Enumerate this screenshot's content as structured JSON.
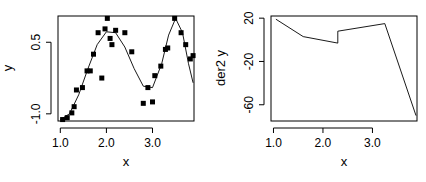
{
  "chart_data": [
    {
      "type": "scatter",
      "title": "",
      "xlabel": "x",
      "ylabel": "y",
      "xlim": [
        0.95,
        3.9
      ],
      "ylim": [
        -1.15,
        1.05
      ],
      "xticks": [
        "1.0",
        "2.0",
        "3.0"
      ],
      "yticks": [
        "-1.0",
        "0.5"
      ],
      "ytick_values": [
        -1.0,
        0.5
      ],
      "xtick_values": [
        1.0,
        2.0,
        3.0
      ],
      "grid": false,
      "legend": null,
      "points": [
        {
          "x": 1.05,
          "y": -1.12
        },
        {
          "x": 1.15,
          "y": -1.08
        },
        {
          "x": 1.25,
          "y": -0.98
        },
        {
          "x": 1.3,
          "y": -0.85
        },
        {
          "x": 1.35,
          "y": -0.5
        },
        {
          "x": 1.48,
          "y": -0.45
        },
        {
          "x": 1.58,
          "y": -0.1
        },
        {
          "x": 1.65,
          "y": -0.1
        },
        {
          "x": 1.72,
          "y": 0.25
        },
        {
          "x": 1.82,
          "y": 0.7
        },
        {
          "x": 1.9,
          "y": -0.25
        },
        {
          "x": 1.97,
          "y": 0.78
        },
        {
          "x": 2.02,
          "y": 1.0
        },
        {
          "x": 2.08,
          "y": 0.58
        },
        {
          "x": 2.12,
          "y": 0.45
        },
        {
          "x": 2.2,
          "y": 0.75
        },
        {
          "x": 2.4,
          "y": 0.7
        },
        {
          "x": 2.55,
          "y": 0.3
        },
        {
          "x": 2.8,
          "y": -0.78
        },
        {
          "x": 2.9,
          "y": -0.45
        },
        {
          "x": 3.0,
          "y": -0.75
        },
        {
          "x": 3.05,
          "y": -0.2
        },
        {
          "x": 3.18,
          "y": 0.0
        },
        {
          "x": 3.28,
          "y": 0.35
        },
        {
          "x": 3.33,
          "y": 0.38
        },
        {
          "x": 3.48,
          "y": 1.0
        },
        {
          "x": 3.62,
          "y": 0.7
        },
        {
          "x": 3.72,
          "y": 0.45
        },
        {
          "x": 3.82,
          "y": 0.15
        },
        {
          "x": 3.88,
          "y": 0.22
        }
      ],
      "fit_curve": [
        {
          "x": 1.0,
          "y": -1.12
        },
        {
          "x": 1.2,
          "y": -1.0
        },
        {
          "x": 1.4,
          "y": -0.6
        },
        {
          "x": 1.6,
          "y": -0.05
        },
        {
          "x": 1.8,
          "y": 0.45
        },
        {
          "x": 2.0,
          "y": 0.72
        },
        {
          "x": 2.2,
          "y": 0.7
        },
        {
          "x": 2.4,
          "y": 0.4
        },
        {
          "x": 2.6,
          "y": -0.05
        },
        {
          "x": 2.8,
          "y": -0.42
        },
        {
          "x": 3.0,
          "y": -0.45
        },
        {
          "x": 3.2,
          "y": 0.05
        },
        {
          "x": 3.35,
          "y": 0.65
        },
        {
          "x": 3.5,
          "y": 1.0
        },
        {
          "x": 3.65,
          "y": 0.7
        },
        {
          "x": 3.78,
          "y": 0.05
        },
        {
          "x": 3.88,
          "y": -0.35
        }
      ]
    },
    {
      "type": "line",
      "title": "",
      "xlabel": "x",
      "ylabel": "der2 y",
      "xlim": [
        0.95,
        3.9
      ],
      "ylim": [
        -75,
        22
      ],
      "xticks": [
        "1.0",
        "2.0",
        "3.0"
      ],
      "xtick_values": [
        1.0,
        2.0,
        3.0
      ],
      "yticks": [
        "20",
        "-20",
        "-60"
      ],
      "ytick_values": [
        20,
        -20,
        -60
      ],
      "grid": false,
      "legend": null,
      "series": [
        {
          "name": "der2 y",
          "x": [
            1.05,
            1.6,
            2.3,
            2.3,
            3.25,
            3.88
          ],
          "y": [
            19,
            3,
            -3,
            8,
            15,
            -70
          ]
        }
      ]
    }
  ],
  "labels": {
    "left": {
      "xlabel": "x",
      "ylabel": "y",
      "xticks": [
        "1.0",
        "2.0",
        "3.0"
      ],
      "yticks": [
        "-1.0",
        "0.5"
      ]
    },
    "right": {
      "xlabel": "x",
      "ylabel": "der2 y",
      "xticks": [
        "1.0",
        "2.0",
        "3.0"
      ],
      "yticks": [
        "20",
        "-20",
        "-60"
      ]
    }
  }
}
